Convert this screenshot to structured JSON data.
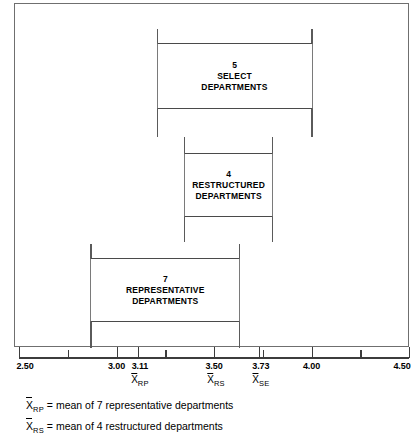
{
  "chart_data": {
    "type": "bar",
    "title": "",
    "xlabel": "",
    "ylabel": "",
    "xlim": [
      2.5,
      4.5
    ],
    "grid": false,
    "legend_position": "below-axis",
    "orientation": "horizontal",
    "axis": {
      "min": 2.5,
      "max": 4.5,
      "major_ticks": [
        2.5,
        3.0,
        3.5,
        4.0,
        4.5
      ],
      "major_tick_labels": [
        "2.50",
        "3.00",
        "3.50",
        "4.00",
        "4.50"
      ],
      "minor_ticks": [
        2.75,
        3.25,
        3.75,
        4.25
      ],
      "special_ticks": [
        3.11,
        3.73
      ],
      "special_tick_labels": [
        "3.11",
        "3.73"
      ]
    },
    "means": [
      {
        "symbol": "X",
        "subscript": "RP",
        "value": 3.11
      },
      {
        "symbol": "X",
        "subscript": "RS",
        "value": 3.5
      },
      {
        "symbol": "X",
        "subscript": "SE",
        "value": 3.73
      }
    ],
    "groups": [
      {
        "count": "5",
        "line1": "SELECT",
        "line2": "DEPARTMENTS",
        "whisker_min": 3.2,
        "whisker_max": 4.0,
        "box_min": 3.21,
        "box_max": 3.99
      },
      {
        "count": "4",
        "line1": "RESTRUCTURED",
        "line2": "DEPARTMENTS",
        "whisker_min": 3.34,
        "whisker_max": 3.8,
        "box_min": 3.35,
        "box_max": 3.79
      },
      {
        "count": "7",
        "line1": "REPRESENTATIVE",
        "line2": "DEPARTMENTS",
        "whisker_min": 2.86,
        "whisker_max": 3.63,
        "box_min": 2.87,
        "box_max": 3.62
      }
    ]
  },
  "legend": {
    "rows": [
      {
        "symbol": "X",
        "subscript": "RP",
        "text": "= mean of 7 representative departments"
      },
      {
        "symbol": "X",
        "subscript": "RS",
        "text": "= mean of 4 restructured departments"
      }
    ]
  }
}
